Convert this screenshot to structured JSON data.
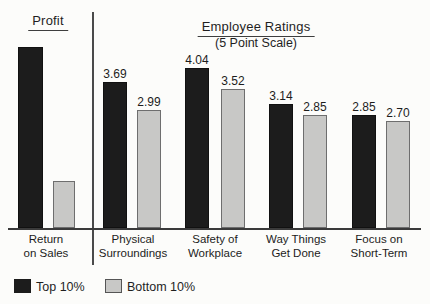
{
  "chart_data": {
    "type": "bar",
    "sections": [
      {
        "title": "Profit",
        "categories": [
          "Return on Sales"
        ],
        "series": [
          {
            "name": "Top 10%",
            "values_px": [
              181
            ]
          },
          {
            "name": "Bottom 10%",
            "values_px": [
              47
            ]
          }
        ],
        "note": "bars have no printed numeric labels"
      },
      {
        "title": "Employee Ratings",
        "subtitle": "(5 Point Scale)",
        "categories": [
          "Physical Surroundings",
          "Safety of Workplace",
          "Way Things Get Done",
          "Focus on Short-Term"
        ],
        "series": [
          {
            "name": "Top 10%",
            "values": [
              3.69,
              4.04,
              3.14,
              2.85
            ]
          },
          {
            "name": "Bottom 10%",
            "values": [
              2.99,
              3.52,
              2.85,
              2.7
            ]
          }
        ],
        "ylim": [
          0,
          5
        ]
      }
    ],
    "legend": [
      {
        "label": "Top 10%",
        "color": "#1c1c1c"
      },
      {
        "label": "Bottom 10%",
        "color": "#c8c8c6"
      }
    ],
    "legend_position": "bottom-left",
    "grid": false
  },
  "titles": {
    "profit": "Profit",
    "ratings": "Employee Ratings",
    "ratings_subtitle": "(5 Point Scale)"
  },
  "category_labels": [
    {
      "line1": "Return",
      "line2": "on Sales"
    },
    {
      "line1": "Physical",
      "line2": "Surroundings"
    },
    {
      "line1": "Safety of",
      "line2": "Workplace"
    },
    {
      "line1": "Way Things",
      "line2": "Get Done"
    },
    {
      "line1": "Focus on",
      "line2": "Short-Term"
    }
  ],
  "legend": {
    "top": "Top 10%",
    "bottom": "Bottom 10%"
  },
  "colors": {
    "bar_black": "#1c1c1c",
    "bar_gray": "#c8c8c6",
    "bar_gray_border": "#6e6e6e",
    "axis_line": "#3a3a3a",
    "divider_line": "#4a4a4a",
    "text": "#1f1f1f",
    "background": "#fcfcfa"
  }
}
